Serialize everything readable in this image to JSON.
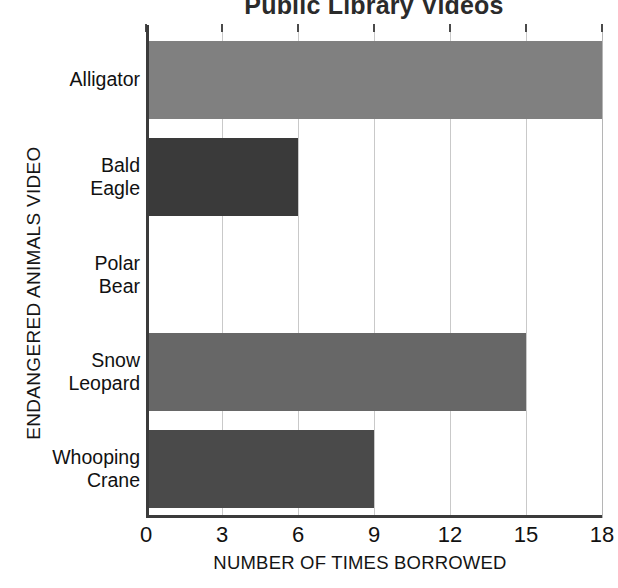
{
  "chart_data": {
    "type": "bar",
    "orientation": "horizontal",
    "title": "Public Library Videos",
    "xlabel": "NUMBER OF TIMES BORROWED",
    "ylabel": "ENDANGERED ANIMALS VIDEO",
    "categories": [
      "Alligator",
      "Bald\nEagle",
      "Polar\nBear",
      "Snow\nLeopard",
      "Whooping\nCrane"
    ],
    "values": [
      18,
      6,
      0,
      15,
      9
    ],
    "xlim": [
      0,
      18
    ],
    "xticks": [
      0,
      3,
      6,
      9,
      12,
      15,
      18
    ],
    "xtick_labels": [
      "0",
      "3",
      "6",
      "9",
      "12",
      "15",
      "18"
    ],
    "grid": "vertical",
    "legend": "none",
    "bar_colors": [
      "#808080",
      "#3a3a3a",
      "#808080",
      "#676767",
      "#4a4a4a"
    ]
  },
  "colors": {
    "background": "#ffffff",
    "axis": "#3b3b3b",
    "gridline": "#c9c9c9",
    "text": "#111111",
    "title": "#2b2b2b"
  }
}
